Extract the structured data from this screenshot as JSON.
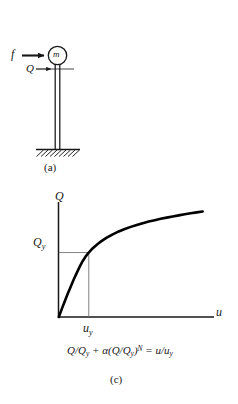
{
  "figure": {
    "panels": [
      {
        "id": "a",
        "caption": "(a)",
        "type": "sdof-column-schematic",
        "labels": {
          "force": "f",
          "mass": "m",
          "shear": "Q"
        },
        "elements": {
          "mass_icon": "circle-mass-icon",
          "force_arrow_icon": "arrow-right-icon",
          "shear_arrow_icon": "arrow-right-small-icon",
          "column_icon": "double-line-column-icon",
          "ground_icon": "hatched-ground-icon"
        }
      },
      {
        "id": "c",
        "caption": "(c)",
        "type": "force-displacement-curve",
        "equation": {
          "t1": "Q/Q",
          "s1": "y",
          "t2": " + α(Q/Q",
          "s2": "y",
          "t3": ")",
          "sup": "N",
          "t4": " = u/u",
          "s3": "y"
        }
      }
    ]
  },
  "chart_data": {
    "type": "line",
    "title": "",
    "subtitle": "",
    "xlabel": "u",
    "ylabel": "Q",
    "xlim": [
      0,
      1.0
    ],
    "ylim": [
      0,
      1.0
    ],
    "grid": false,
    "legend": null,
    "axis_labels": {
      "y_axis_name": "Q",
      "x_axis_name": "u",
      "y_tick_label": "Qy",
      "x_tick_label": "uy"
    },
    "annotations": [
      {
        "name": "yield-point-guides",
        "desc": "Dashed/thin guide lines from Qy on y-axis and uy on x-axis meeting at the yield point of the backbone curve",
        "x": 0.205,
        "y": 0.537
      }
    ],
    "series": [
      {
        "name": "Ramberg-Osgood backbone",
        "x": [
          0.0,
          0.02,
          0.041,
          0.061,
          0.082,
          0.102,
          0.123,
          0.143,
          0.164,
          0.184,
          0.205,
          0.225,
          0.246,
          0.266,
          0.287,
          0.307,
          0.328,
          0.369,
          0.41,
          0.451,
          0.492,
          0.533,
          0.574,
          0.615,
          0.656,
          0.697,
          0.738,
          0.779,
          0.82,
          0.861,
          0.902,
          0.943,
          0.984
        ],
        "y": [
          0.0,
          0.066,
          0.131,
          0.194,
          0.255,
          0.313,
          0.368,
          0.42,
          0.467,
          0.505,
          0.537,
          0.564,
          0.588,
          0.609,
          0.628,
          0.645,
          0.661,
          0.689,
          0.713,
          0.733,
          0.751,
          0.767,
          0.782,
          0.795,
          0.807,
          0.818,
          0.828,
          0.838,
          0.847,
          0.856,
          0.864,
          0.872,
          0.879
        ]
      }
    ],
    "yield_point": {
      "x": 0.205,
      "y": 0.537
    }
  },
  "style": {
    "ink": "#171717",
    "curve_color": "#000000",
    "guide_color": "#555555",
    "background": "#ffffff"
  }
}
